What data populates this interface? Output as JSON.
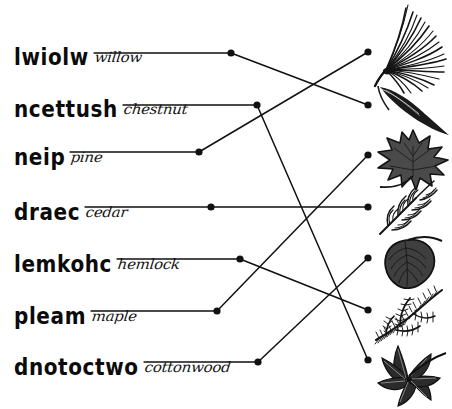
{
  "worksheet": {
    "title": "Tree name unscramble and leaf matching worksheet",
    "ink_color": "#111111",
    "paper_color": "#ffffff",
    "rows": [
      {
        "scrambled": "lwiolw",
        "answer": "willow",
        "left_dot": {
          "x": 231,
          "y": 53
        },
        "answer_rule_width": 122,
        "connects_to_image": "willow-leaf"
      },
      {
        "scrambled": "ncettush",
        "answer": "chestnut",
        "left_dot": {
          "x": 257,
          "y": 105
        },
        "answer_rule_width": 126,
        "connects_to_image": "chestnut-leaf"
      },
      {
        "scrambled": "neip",
        "answer": "pine",
        "left_dot": {
          "x": 199,
          "y": 152
        },
        "answer_rule_width": 133,
        "connects_to_image": "pine-needles"
      },
      {
        "scrambled": "draec",
        "answer": "cedar",
        "left_dot": {
          "x": 211,
          "y": 207
        },
        "answer_rule_width": 130,
        "connects_to_image": "cedar-spray"
      },
      {
        "scrambled": "lemkohc",
        "answer": "hemlock",
        "left_dot": {
          "x": 240,
          "y": 259
        },
        "answer_rule_width": 120,
        "connects_to_image": "hemlock-branch"
      },
      {
        "scrambled": "pleam",
        "answer": "maple",
        "left_dot": {
          "x": 217,
          "y": 311
        },
        "answer_rule_width": 122,
        "connects_to_image": "maple-leaf"
      },
      {
        "scrambled": "dnotoctwo",
        "answer": "cottonwood",
        "left_dot": {
          "x": 258,
          "y": 362
        },
        "answer_rule_width": 110,
        "connects_to_image": "cottonwood-leaf"
      }
    ],
    "images": [
      {
        "name": "pine-needles",
        "dot": {
          "x": 368,
          "y": 52
        }
      },
      {
        "name": "willow-leaf",
        "dot": {
          "x": 368,
          "y": 105
        }
      },
      {
        "name": "maple-leaf",
        "dot": {
          "x": 368,
          "y": 155
        }
      },
      {
        "name": "cedar-spray",
        "dot": {
          "x": 368,
          "y": 207
        }
      },
      {
        "name": "cottonwood-leaf",
        "dot": {
          "x": 368,
          "y": 258
        }
      },
      {
        "name": "hemlock-branch",
        "dot": {
          "x": 368,
          "y": 310
        }
      },
      {
        "name": "chestnut-leaf",
        "dot": {
          "x": 368,
          "y": 360
        }
      }
    ],
    "connections": [
      {
        "from": "willow",
        "to": "willow-leaf"
      },
      {
        "from": "chestnut",
        "to": "chestnut-leaf"
      },
      {
        "from": "pine",
        "to": "pine-needles"
      },
      {
        "from": "cedar",
        "to": "cedar-spray"
      },
      {
        "from": "hemlock",
        "to": "hemlock-branch"
      },
      {
        "from": "maple",
        "to": "maple-leaf"
      },
      {
        "from": "cottonwood",
        "to": "cottonwood-leaf"
      }
    ]
  }
}
